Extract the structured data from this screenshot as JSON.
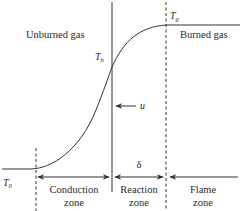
{
  "diagram": {
    "type": "flame-temperature-profile",
    "regions": {
      "left": "Unburned gas",
      "right": "Burned gas"
    },
    "temperatures": {
      "initial": {
        "symbol": "T",
        "subscript": "0"
      },
      "ignition": {
        "symbol": "T",
        "subscript": "b"
      },
      "adiabatic": {
        "symbol": "T",
        "subscript": "g"
      }
    },
    "velocity_label": "u",
    "thickness_label": "δ",
    "zones": [
      {
        "line1": "Conduction",
        "line2": "zone"
      },
      {
        "line1": "Reaction",
        "line2": "zone"
      },
      {
        "line1": "Flame",
        "line2": "zone"
      }
    ],
    "colors": {
      "line": "#333333",
      "text": "#2a2a2a",
      "background": "#ffffff"
    }
  }
}
